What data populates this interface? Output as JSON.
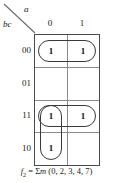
{
  "figure": {
    "type": "karnaugh-map",
    "column_variable": "a",
    "row_variable": "bc",
    "column_headers": [
      "0",
      "1"
    ],
    "row_headers": [
      "00",
      "01",
      "11",
      "10"
    ],
    "cells": [
      {
        "row": "00",
        "col": "0",
        "value": "1"
      },
      {
        "row": "00",
        "col": "1",
        "value": "1"
      },
      {
        "row": "01",
        "col": "0",
        "value": ""
      },
      {
        "row": "01",
        "col": "1",
        "value": ""
      },
      {
        "row": "11",
        "col": "0",
        "value": "1"
      },
      {
        "row": "11",
        "col": "1",
        "value": "1"
      },
      {
        "row": "10",
        "col": "0",
        "value": "1"
      },
      {
        "row": "10",
        "col": "1",
        "value": ""
      }
    ],
    "groups": [
      {
        "name": "row-00-pair",
        "cells": [
          "00-0",
          "00-1"
        ]
      },
      {
        "name": "row-11-pair",
        "cells": [
          "11-0",
          "11-1"
        ]
      },
      {
        "name": "col-0-pair",
        "cells": [
          "11-0",
          "10-0"
        ]
      }
    ],
    "caption": {
      "function_name": "f",
      "function_subscript": "2",
      "equals": "=",
      "sigma": "Σ",
      "m": "m",
      "minterms": "(0, 2, 3, 4, 7)",
      "full_text": "f2 = Σm (0, 2, 3, 4, 7)"
    },
    "colors": {
      "grid_border": "#4a4a4a",
      "grid_inner": "#8a8a8a",
      "oval": "#3a3a3a",
      "text": "#1a1a1a",
      "background": "#ffffff"
    }
  }
}
